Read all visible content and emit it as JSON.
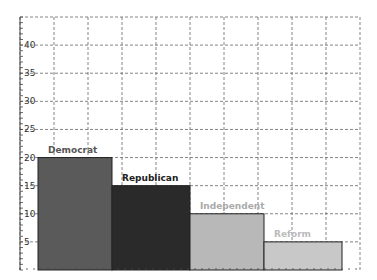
{
  "chart_data": {
    "type": "bar",
    "title": "",
    "xlabel": "",
    "ylabel": "",
    "categories": [
      "Democrat",
      "Republican",
      "Independent",
      "Reform"
    ],
    "values": [
      20,
      15,
      10,
      5
    ],
    "colors": [
      "#5a5a5a",
      "#2a2a2a",
      "#b8b8b8",
      "#c8c8c8"
    ],
    "label_colors": [
      "#555555",
      "#222222",
      "#aaaaaa",
      "#bbbbbb"
    ],
    "ylim": [
      0,
      45
    ],
    "yticks": [
      5,
      10,
      15,
      20,
      25,
      30,
      35,
      40
    ],
    "grid": true,
    "grid_style": "dashed",
    "legend": "none (labels above bars)"
  }
}
